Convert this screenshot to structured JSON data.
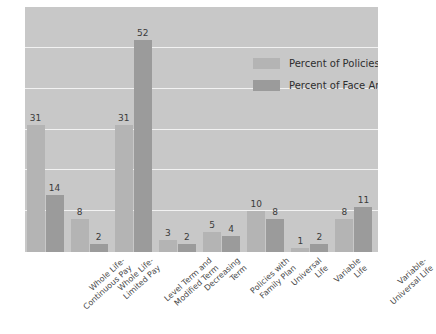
{
  "chart_data": {
    "type": "bar",
    "title": "",
    "subtitle": "",
    "xlabel": "",
    "ylabel": "",
    "ylim": [
      0,
      60
    ],
    "grid": true,
    "gridlines": [
      10,
      20,
      30,
      40,
      50,
      60
    ],
    "legend_position": "top-right",
    "categories": [
      "Whole Life-Continuous Pay",
      "Whole Life-Limited Pay",
      "Level Term and Modified Term",
      "Decreasing Term",
      "Policies with Family Plan",
      "Universal Life",
      "Variable Life",
      "Variable-Universal Life"
    ],
    "category_lines": [
      [
        "Whole Life-",
        "Continuous Pay"
      ],
      [
        "Whole Life-",
        "Limited Pay"
      ],
      [
        "Level Term and",
        "Modified Term"
      ],
      [
        "Decreasing",
        "Term"
      ],
      [
        "Policies with",
        "Family Plan"
      ],
      [
        "Universal",
        "Life"
      ],
      [
        "Variable",
        "Life"
      ],
      [
        "Variable-",
        "Universal Life"
      ]
    ],
    "series": [
      {
        "name": "Percent of Policies",
        "color": "#b4b4b4",
        "values": [
          31,
          8,
          31,
          3,
          5,
          10,
          1,
          8
        ]
      },
      {
        "name": "Percent of Face Amount",
        "color": "#9b9b9b",
        "values": [
          14,
          2,
          52,
          2,
          4,
          8,
          2,
          11
        ]
      }
    ]
  },
  "legend": {
    "items": [
      {
        "label": "Percent of Policies"
      },
      {
        "label": "Percent of Face Amount"
      }
    ]
  },
  "colors": {
    "plot_background": "#c8c8c8",
    "gridline": "#f2f2f2",
    "series_policies": "#b4b4b4",
    "series_face_amount": "#9b9b9b",
    "value_text": "#3b3b3b",
    "label_text": "#4a4a4a",
    "page_background": "#ffffff"
  }
}
